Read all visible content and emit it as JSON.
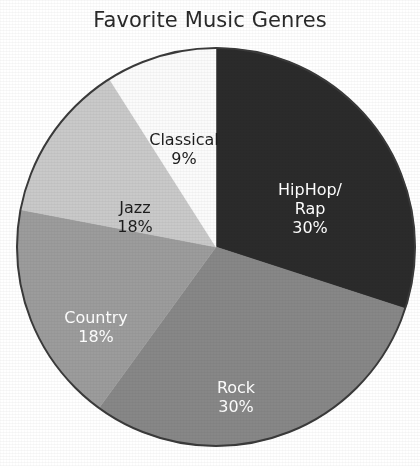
{
  "chart_data": {
    "type": "pie",
    "title": "Favorite Music Genres",
    "categories": [
      "HipHop/Rap",
      "Rock",
      "Country",
      "Jazz",
      "Classical"
    ],
    "values": [
      30,
      18,
      18,
      30,
      9
    ],
    "unit": "%",
    "legend": "none",
    "slices": [
      {
        "name": "HipHop/Rap",
        "label_line1": "HipHop/",
        "label_line2": "Rap",
        "value": 30,
        "value_label": "30%",
        "color": "#2b2b2b",
        "text_color": "#ffffff",
        "start_angle_deg": 0,
        "end_angle_deg": 108
      },
      {
        "name": "Rock",
        "label_line1": "Rock",
        "label_line2": "",
        "value": 30,
        "value_label": "30%",
        "color": "#878787",
        "text_color": "#ffffff",
        "start_angle_deg": 108,
        "end_angle_deg": 216
      },
      {
        "name": "Country",
        "label_line1": "Country",
        "label_line2": "",
        "value": 18,
        "value_label": "18%",
        "color": "#9c9c9c",
        "text_color": "#ffffff",
        "start_angle_deg": 216,
        "end_angle_deg": 280.8
      },
      {
        "name": "Jazz",
        "label_line1": "Jazz",
        "label_line2": "",
        "value": 18,
        "value_label": "18%",
        "color": "#c9c9c9",
        "text_color": "#1d1d1d",
        "start_angle_deg": 280.8,
        "end_angle_deg": 327.6
      },
      {
        "name": "Classical",
        "label_line1": "Classical",
        "label_line2": "",
        "value": 9,
        "value_label": "9%",
        "color": "#fbfbfb",
        "text_color": "#1d1d1d",
        "start_angle_deg": 327.6,
        "end_angle_deg": 360
      }
    ],
    "geometry": {
      "center_x": 201,
      "center_y": 201,
      "radius": 199,
      "outline_color": "#3a3a3a"
    }
  }
}
